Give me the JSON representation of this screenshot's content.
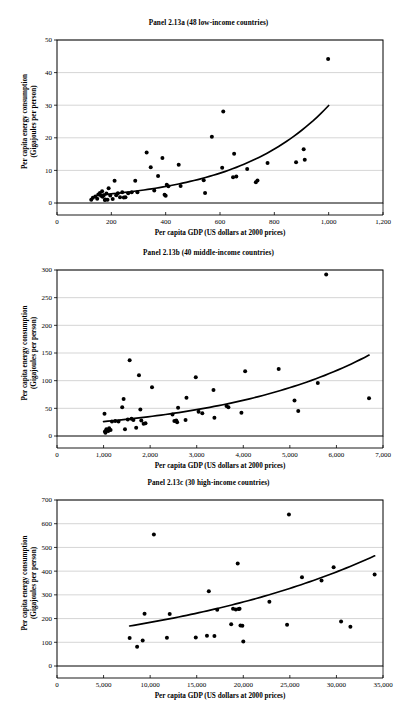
{
  "document": {
    "figure_label": "Panel 2.13 series",
    "background": "#ffffff",
    "ink": "#000000",
    "gridline_color": "#b8b8b8"
  },
  "axis_titles": {
    "x": "Per capita GDP (US dollars at 2000 prices)",
    "y_line1": "Per capita energy consumption",
    "y_line2": "(Gigajoules per person)"
  },
  "chart_data": [
    {
      "id": "panel-a",
      "type": "scatter",
      "title": "Panel 2.13a (48 low-income countries)",
      "xlabel": "Per capita GDP (US dollars at 2000 prices)",
      "ylabel": "Per capita energy consumption (Gigajoules per person)",
      "xlim": [
        0,
        1200
      ],
      "ylim": [
        0,
        50
      ],
      "xticks": [
        0,
        200,
        400,
        600,
        800,
        1000,
        1200
      ],
      "xticklabels": [
        "0",
        "200",
        "400",
        "600",
        "800",
        "1,000",
        "1,200"
      ],
      "yticks": [
        0,
        10,
        20,
        30,
        40,
        50
      ],
      "yticklabels": [
        "0",
        "10",
        "20",
        "30",
        "40",
        "50"
      ],
      "grid": "horizontal",
      "legend": "none",
      "marker": "filled-circle",
      "points": [
        [
          126,
          1.0
        ],
        [
          132,
          1.6
        ],
        [
          141,
          2.0
        ],
        [
          148,
          1.3
        ],
        [
          152,
          2.6
        ],
        [
          158,
          3.1
        ],
        [
          162,
          2.2
        ],
        [
          166,
          3.6
        ],
        [
          168,
          1.9
        ],
        [
          172,
          2.4
        ],
        [
          176,
          0.9
        ],
        [
          178,
          1.1
        ],
        [
          182,
          2.9
        ],
        [
          186,
          1.0
        ],
        [
          190,
          4.5
        ],
        [
          196,
          2.3
        ],
        [
          205,
          1.2
        ],
        [
          212,
          6.8
        ],
        [
          218,
          2.4
        ],
        [
          224,
          3.0
        ],
        [
          232,
          1.8
        ],
        [
          240,
          3.3
        ],
        [
          246,
          1.7
        ],
        [
          252,
          1.8
        ],
        [
          262,
          3.0
        ],
        [
          275,
          3.3
        ],
        [
          288,
          6.8
        ],
        [
          296,
          3.3
        ],
        [
          330,
          15.5
        ],
        [
          345,
          11.0
        ],
        [
          358,
          3.8
        ],
        [
          372,
          8.3
        ],
        [
          388,
          13.8
        ],
        [
          396,
          2.5
        ],
        [
          400,
          2.2
        ],
        [
          404,
          5.6
        ],
        [
          410,
          5.1
        ],
        [
          448,
          11.7
        ],
        [
          455,
          5.2
        ],
        [
          540,
          7.0
        ],
        [
          545,
          3.1
        ],
        [
          570,
          20.3
        ],
        [
          608,
          10.8
        ],
        [
          612,
          28.1
        ],
        [
          648,
          7.9
        ],
        [
          652,
          15.1
        ],
        [
          660,
          8.1
        ],
        [
          700,
          10.4
        ],
        [
          732,
          6.4
        ],
        [
          738,
          6.9
        ],
        [
          775,
          12.3
        ],
        [
          880,
          12.5
        ],
        [
          908,
          16.5
        ],
        [
          912,
          13.3
        ],
        [
          998,
          44.2
        ]
      ],
      "trend": {
        "type": "exponential",
        "xstart": 150,
        "xend": 1000,
        "coefficients": {
          "a": 1.55,
          "b": 0.00296
        }
      }
    },
    {
      "id": "panel-b",
      "type": "scatter",
      "title": "Panel 2.13b (40 middle-income countries)",
      "xlabel": "Per capita GDP (US dollars at 2000 prices)",
      "ylabel": "Per capita energy consumption (Gigajoules per person)",
      "xlim": [
        0,
        7000
      ],
      "ylim": [
        0,
        300
      ],
      "xticks": [
        0,
        1000,
        2000,
        3000,
        4000,
        5000,
        6000,
        7000
      ],
      "xticklabels": [
        "0",
        "1,000",
        "2,000",
        "3,000",
        "4,000",
        "5,000",
        "6,000",
        "7,000"
      ],
      "yticks": [
        0,
        50,
        100,
        150,
        200,
        250,
        300
      ],
      "yticklabels": [
        "0",
        "50",
        "100",
        "150",
        "200",
        "250",
        "300"
      ],
      "grid": "horizontal",
      "legend": "none",
      "marker": "filled-circle",
      "points": [
        [
          1020,
          40
        ],
        [
          1030,
          8
        ],
        [
          1040,
          6
        ],
        [
          1060,
          12
        ],
        [
          1080,
          10
        ],
        [
          1100,
          9
        ],
        [
          1120,
          14
        ],
        [
          1150,
          11
        ],
        [
          1180,
          26
        ],
        [
          1250,
          27
        ],
        [
          1320,
          26
        ],
        [
          1400,
          52
        ],
        [
          1430,
          67
        ],
        [
          1460,
          12
        ],
        [
          1520,
          30
        ],
        [
          1560,
          137
        ],
        [
          1600,
          31
        ],
        [
          1640,
          29
        ],
        [
          1700,
          15
        ],
        [
          1760,
          110
        ],
        [
          1790,
          48
        ],
        [
          1810,
          28
        ],
        [
          1860,
          22
        ],
        [
          1900,
          23
        ],
        [
          2040,
          88
        ],
        [
          2480,
          39
        ],
        [
          2520,
          27
        ],
        [
          2560,
          28
        ],
        [
          2580,
          25
        ],
        [
          2600,
          51
        ],
        [
          2760,
          29
        ],
        [
          2780,
          69
        ],
        [
          2980,
          106
        ],
        [
          3040,
          44
        ],
        [
          3120,
          41
        ],
        [
          3360,
          83
        ],
        [
          3380,
          33
        ],
        [
          3640,
          54
        ],
        [
          3680,
          52
        ],
        [
          3960,
          42
        ],
        [
          4040,
          117
        ],
        [
          4760,
          121
        ],
        [
          5100,
          64
        ],
        [
          5180,
          45
        ],
        [
          5600,
          96
        ],
        [
          5780,
          292
        ],
        [
          6700,
          68
        ]
      ],
      "trend": {
        "type": "exponential",
        "xstart": 1000,
        "xend": 6700,
        "coefficients": {
          "a": 19.2,
          "b": 0.000303
        }
      }
    },
    {
      "id": "panel-c",
      "type": "scatter",
      "title": "Panel 2.13c (30 high-income countries)",
      "xlabel": "Per capita GDP (US dollars at 2000 prices)",
      "ylabel": "Per capita energy consumption (Gigajoules per person)",
      "xlim": [
        0,
        35000
      ],
      "ylim": [
        0,
        700
      ],
      "xticks": [
        0,
        5000,
        10000,
        15000,
        20000,
        25000,
        30000,
        35000
      ],
      "xticklabels": [
        "0",
        "5,000",
        "10,000",
        "15,000",
        "20,000",
        "25,000",
        "30,000",
        "35,000"
      ],
      "yticks": [
        0,
        100,
        200,
        300,
        400,
        500,
        600,
        700
      ],
      "yticklabels": [
        "0",
        "100",
        "200",
        "300",
        "400",
        "500",
        "600",
        "700"
      ],
      "grid": "horizontal",
      "legend": "none",
      "marker": "filled-circle",
      "points": [
        [
          7800,
          118
        ],
        [
          8600,
          81
        ],
        [
          9200,
          108
        ],
        [
          9400,
          220
        ],
        [
          10400,
          555
        ],
        [
          11800,
          119
        ],
        [
          12100,
          219
        ],
        [
          14900,
          120
        ],
        [
          16100,
          128
        ],
        [
          16300,
          315
        ],
        [
          16900,
          126
        ],
        [
          17200,
          237
        ],
        [
          18700,
          176
        ],
        [
          18900,
          241
        ],
        [
          19200,
          238
        ],
        [
          19400,
          432
        ],
        [
          19500,
          240
        ],
        [
          19600,
          241
        ],
        [
          19700,
          171
        ],
        [
          19900,
          170
        ],
        [
          20000,
          103
        ],
        [
          22800,
          271
        ],
        [
          24700,
          174
        ],
        [
          24900,
          639
        ],
        [
          26300,
          374
        ],
        [
          28400,
          361
        ],
        [
          29700,
          416
        ],
        [
          30500,
          188
        ],
        [
          31500,
          165
        ],
        [
          34100,
          386
        ]
      ],
      "trend": {
        "type": "exponential",
        "xstart": 7800,
        "xend": 34100,
        "coefficients": {
          "a": 125.0,
          "b": 3.85e-05
        }
      }
    }
  ]
}
